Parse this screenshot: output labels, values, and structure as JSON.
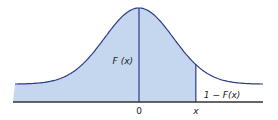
{
  "chart_data": {
    "type": "area",
    "title": "",
    "xlabel": "",
    "ylabel": "",
    "x_ticks": [
      "0",
      "x"
    ],
    "shaded_label": "F (x)",
    "tail_label": "1 − F(x)",
    "xlim": [
      -3.6,
      3.6
    ],
    "mean": 0,
    "sd": 1,
    "x_marker": 1.65,
    "fill_color": "#c5d6ef",
    "line_color": "#2b3a8a"
  }
}
